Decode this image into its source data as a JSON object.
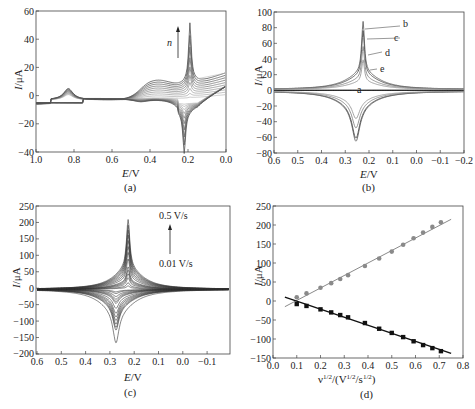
{
  "chart_data": [
    {
      "panel": "(a)",
      "type": "line",
      "title": "",
      "xlabel": "E/V",
      "ylabel": "I/μA",
      "xlim": [
        1.0,
        0.0
      ],
      "ylim": [
        -40,
        60
      ],
      "xticks": [
        "1.0",
        "0.8",
        "0.6",
        "0.4",
        "0.2",
        "0.0"
      ],
      "yticks": [
        "60",
        "40",
        "20",
        "0",
        "-20",
        "-40"
      ],
      "annotations": [
        {
          "text": "n",
          "arrow": "up",
          "x": 0.26,
          "y_from": 28,
          "y_to": 48
        }
      ],
      "description": "Successive CV cycles; anodic peak ~0.19 V rising to ~52 μA, cathodic peak ~0.22 V to ~-27 μA, broad peaks near 0.83 V and 0.38 V",
      "series_count": 10,
      "anodic_peak": {
        "E": 0.19,
        "I_max": 52
      },
      "cathodic_peak": {
        "E": 0.22,
        "I_min": -27
      }
    },
    {
      "panel": "(b)",
      "type": "line",
      "xlabel": "E/V",
      "ylabel": "I/μA",
      "xlim": [
        0.6,
        -0.2
      ],
      "ylim": [
        -80,
        100
      ],
      "xticks": [
        "0.6",
        "0.5",
        "0.4",
        "0.3",
        "0.2",
        "0.1",
        "0.0",
        "-0.1",
        "-0.2"
      ],
      "yticks": [
        "100",
        "80",
        "60",
        "40",
        "20",
        "0",
        "-20",
        "-40",
        "-60",
        "-80"
      ],
      "legend": [
        "a",
        "b",
        "c",
        "d",
        "e"
      ],
      "series": [
        {
          "name": "a",
          "anodic_peak": 0,
          "cathodic_peak": 0
        },
        {
          "name": "b",
          "anodic_peak": 87,
          "cathodic_peak": -64
        },
        {
          "name": "c",
          "anodic_peak": 75,
          "cathodic_peak": -60
        },
        {
          "name": "d",
          "anodic_peak": 55,
          "cathodic_peak": -47
        },
        {
          "name": "e",
          "anodic_peak": 38,
          "cathodic_peak": -35
        }
      ],
      "anodic_peak_E": 0.225,
      "cathodic_peak_E": 0.255
    },
    {
      "panel": "(c)",
      "type": "line",
      "xlabel": "E/V",
      "ylabel": "I/μA",
      "xlim": [
        0.6,
        -0.2
      ],
      "ylim": [
        -200,
        250
      ],
      "xticks": [
        "0.6",
        "0.5",
        "0.4",
        "0.3",
        "0.2",
        "0.1",
        "0.0",
        "-0.1"
      ],
      "yticks": [
        "250",
        "200",
        "150",
        "100",
        "50",
        "0",
        "-50",
        "-100",
        "-150",
        "-200"
      ],
      "annotations": [
        {
          "text_top": "0.5 V/s",
          "text_bottom": "0.01 V/s",
          "arrow": "up"
        }
      ],
      "scan_rates": [
        0.01,
        0.02,
        0.04,
        0.06,
        0.08,
        0.1,
        0.15,
        0.2,
        0.25,
        0.3,
        0.35,
        0.4,
        0.45,
        0.5
      ],
      "anodic_peaks": [
        10,
        20,
        35,
        47,
        58,
        68,
        92,
        112,
        130,
        148,
        165,
        180,
        195,
        212
      ],
      "cathodic_peaks": [
        -8,
        -13,
        -22,
        -30,
        -37,
        -43,
        -58,
        -73,
        -84,
        -95,
        -106,
        -116,
        -124,
        -163
      ],
      "anodic_peak_E": 0.225,
      "cathodic_peak_E": 0.275
    },
    {
      "panel": "(d)",
      "type": "scatter",
      "xlabel": "v^1/2/(V^1/2/s^1/2)",
      "ylabel": "I/μA",
      "xlim": [
        0.0,
        0.8
      ],
      "ylim": [
        -150,
        250
      ],
      "xticks": [
        "0.0",
        "0.1",
        "0.2",
        "0.3",
        "0.4",
        "0.5",
        "0.6",
        "0.7",
        "0.8"
      ],
      "yticks": [
        "250",
        "200",
        "150",
        "100",
        "50",
        "0",
        "-50",
        "-100",
        "-150"
      ],
      "x": [
        0.1,
        0.141,
        0.2,
        0.245,
        0.283,
        0.316,
        0.387,
        0.447,
        0.5,
        0.548,
        0.592,
        0.632,
        0.671,
        0.707
      ],
      "series": [
        {
          "name": "anodic",
          "marker": "circle",
          "color": "#8a8a8a",
          "values": [
            10,
            20,
            35,
            47,
            58,
            68,
            92,
            112,
            130,
            148,
            165,
            180,
            195,
            207
          ],
          "fit": {
            "x0": 0.05,
            "y0": -15,
            "x1": 0.75,
            "y1": 215
          }
        },
        {
          "name": "cathodic",
          "marker": "square",
          "color": "#111111",
          "values": [
            -8,
            -13,
            -22,
            -30,
            -37,
            -43,
            -58,
            -73,
            -84,
            -95,
            -106,
            -116,
            -124,
            -132
          ],
          "fit": {
            "x0": 0.05,
            "y0": 10,
            "x1": 0.75,
            "y1": -138
          }
        }
      ]
    }
  ],
  "labels": {
    "a": {
      "xlabel": "E/V",
      "ylabel": "I/μA",
      "panel": "(a)",
      "arrow_label": "n"
    },
    "b": {
      "xlabel": "E/V",
      "ylabel": "I/μA",
      "panel": "(b)",
      "curve_labels": [
        "b",
        "c",
        "d",
        "e",
        "a"
      ]
    },
    "c": {
      "xlabel": "E/V",
      "ylabel": "I/μA",
      "panel": "(c)",
      "rate_high": "0.5 V/s",
      "rate_low": "0.01 V/s"
    },
    "d": {
      "xlabel_main": "ν",
      "xlabel_rest": "/(V",
      "ylabel": "I/μA",
      "panel": "(d)"
    }
  },
  "ticks": {
    "a_x": [
      "1.0",
      "0.8",
      "0.6",
      "0.4",
      "0.2",
      "0.0"
    ],
    "a_y": [
      "60",
      "40",
      "20",
      "0",
      "−20",
      "−40"
    ],
    "b_x": [
      "0.6",
      "0.5",
      "0.4",
      "0.3",
      "0.2",
      "0.1",
      "0.0",
      "−0.1",
      "−0.2"
    ],
    "b_y": [
      "100",
      "80",
      "60",
      "40",
      "20",
      "0",
      "−20",
      "−40",
      "−60",
      "−80"
    ],
    "c_x": [
      "0.6",
      "0.5",
      "0.4",
      "0.3",
      "0.2",
      "0.1",
      "0.0",
      "−0.1"
    ],
    "c_y": [
      "250",
      "200",
      "150",
      "100",
      "50",
      "0",
      "−50",
      "−100",
      "−150",
      "−200"
    ],
    "d_x": [
      "0.0",
      "0.1",
      "0.2",
      "0.3",
      "0.4",
      "0.5",
      "0.6",
      "0.7",
      "0.8"
    ],
    "d_y": [
      "250",
      "200",
      "150",
      "100",
      "50",
      "0",
      "−50",
      "−100",
      "−150"
    ]
  }
}
